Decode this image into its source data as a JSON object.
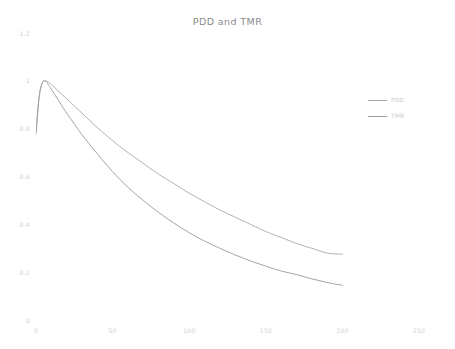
{
  "chart_data": {
    "type": "line",
    "title": "PDD and TMR",
    "xlabel": "",
    "ylabel": "",
    "xlim": [
      0,
      250
    ],
    "ylim": [
      0,
      1.2
    ],
    "grid": false,
    "legend_position": "right",
    "x_ticks": [
      "0",
      "50",
      "100",
      "150",
      "200",
      "250"
    ],
    "x_tick_values": [
      0,
      50,
      100,
      150,
      200,
      250
    ],
    "y_ticks": [
      "0",
      "0.2",
      "0.4",
      "0.6",
      "0.8",
      "1",
      "1.2"
    ],
    "y_tick_values": [
      0,
      0.2,
      0.4,
      0.6,
      0.8,
      1,
      1.2
    ],
    "x": [
      0,
      2,
      4,
      6,
      8,
      10,
      15,
      20,
      25,
      30,
      40,
      50,
      60,
      70,
      80,
      90,
      100,
      110,
      120,
      130,
      140,
      150,
      160,
      170,
      180,
      190,
      200
    ],
    "series": [
      {
        "name": "PDD",
        "color": "#a9a9a9",
        "values": [
          0.78,
          0.93,
          0.99,
          1.0,
          0.995,
          0.985,
          0.955,
          0.925,
          0.895,
          0.865,
          0.805,
          0.75,
          0.7,
          0.655,
          0.61,
          0.57,
          0.53,
          0.495,
          0.46,
          0.43,
          0.4,
          0.37,
          0.345,
          0.32,
          0.3,
          0.28,
          0.275
        ]
      },
      {
        "name": "TMR",
        "color": "#9a9a9a",
        "values": [
          0.78,
          0.93,
          0.99,
          1.0,
          0.985,
          0.965,
          0.915,
          0.865,
          0.82,
          0.775,
          0.695,
          0.62,
          0.555,
          0.5,
          0.45,
          0.405,
          0.365,
          0.33,
          0.3,
          0.272,
          0.247,
          0.225,
          0.205,
          0.19,
          0.172,
          0.157,
          0.145
        ]
      }
    ],
    "legend": [
      {
        "label": "PDD",
        "color": "#a9a9a9"
      },
      {
        "label": "TMR",
        "color": "#9a9a9a"
      }
    ]
  }
}
